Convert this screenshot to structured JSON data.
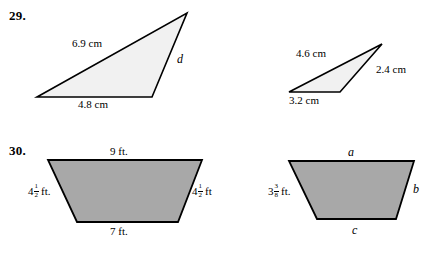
{
  "page": {
    "background_color": "#ffffff",
    "text_color": "#000000"
  },
  "problems": [
    {
      "number": "29.",
      "figures": [
        {
          "name": "triangle-left",
          "shape": "triangle",
          "fill": "#f1f1f1",
          "stroke": "#000000",
          "labels": {
            "hypotenuse": "6.9 cm",
            "base": "4.8 cm",
            "right_side": "d"
          }
        },
        {
          "name": "triangle-right",
          "shape": "triangle",
          "fill": "#f1f1f1",
          "stroke": "#000000",
          "labels": {
            "hypotenuse": "4.6 cm",
            "base": "3.2 cm",
            "right_side": "2.4 cm"
          }
        }
      ]
    },
    {
      "number": "30.",
      "figures": [
        {
          "name": "trapezoid-left",
          "shape": "trapezoid",
          "fill": "#a8a8a8",
          "stroke": "#000000",
          "labels": {
            "top": "9 ft.",
            "bottom": "7 ft.",
            "left_whole": "4",
            "left_numerator": "1",
            "left_denominator": "2",
            "left_unit": "ft.",
            "right_whole": "4",
            "right_numerator": "1",
            "right_denominator": "2",
            "right_unit": "ft"
          }
        },
        {
          "name": "trapezoid-right",
          "shape": "trapezoid",
          "fill": "#a8a8a8",
          "stroke": "#000000",
          "labels": {
            "top": "a",
            "bottom": "c",
            "right": "b",
            "left_whole": "3",
            "left_numerator": "3",
            "left_denominator": "8",
            "left_unit": "ft."
          }
        }
      ]
    }
  ]
}
